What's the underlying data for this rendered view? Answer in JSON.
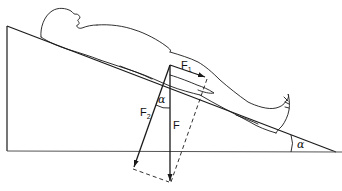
{
  "figure": {
    "labels": {
      "f1": "F",
      "f1_sub": "1",
      "f2": "F",
      "f2_sub": "2",
      "f": "F",
      "alpha_vectors": "α",
      "alpha_incline": "α"
    },
    "colors": {
      "stroke": "#1a1a1a",
      "background": "#ffffff"
    }
  }
}
